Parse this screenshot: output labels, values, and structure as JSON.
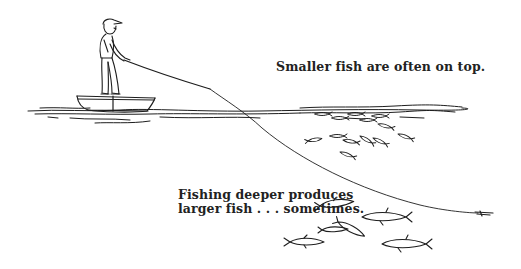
{
  "illustration": {
    "captions": {
      "top": "Smaller fish are often on top.",
      "bottom_line1": "Fishing deeper produces",
      "bottom_line2": "larger fish . . . sometimes."
    },
    "elements": {
      "angler": "angler-standing-in-boat",
      "boat": "small-rowboat",
      "rod": "fishing-rod",
      "line": "fishing-line",
      "lure": "lure",
      "surface_fish_school": "small-fish-school-near-surface",
      "deep_fish_group": "large-fish-group-deep"
    },
    "colors": {
      "ink": "#1e1e1e",
      "background": "#ffffff"
    }
  }
}
